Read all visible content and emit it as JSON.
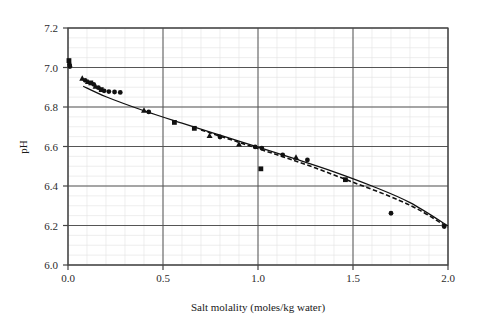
{
  "chart_data": {
    "type": "scatter",
    "title": "",
    "xlabel": "Salt molality (moles/kg water)",
    "ylabel": "pH",
    "xlim": [
      0.0,
      2.0
    ],
    "ylim": [
      6.0,
      7.2
    ],
    "xticks": [
      "0.0",
      "0.5",
      "1.0",
      "1.5",
      "2.0"
    ],
    "xtick_values": [
      0.0,
      0.5,
      1.0,
      1.5,
      2.0
    ],
    "yticks": [
      "6.0",
      "6.2",
      "6.4",
      "6.6",
      "6.8",
      "7.0",
      "7.2"
    ],
    "ytick_values": [
      6.0,
      6.2,
      6.4,
      6.6,
      6.8,
      7.0,
      7.2
    ],
    "grid": "major-horizontal-and-vertical-plus-faint-minor",
    "legend": "none",
    "minor_x_step": 0.1,
    "minor_y_step": 0.05,
    "colors": {
      "marker": "#111111",
      "fit_solid": "#111111",
      "fit_dashed": "#111111",
      "major_grid": "#555555",
      "minor_grid": "#e3e3e3",
      "axis": "#444444",
      "background": "#ffffff"
    },
    "series": [
      {
        "name": "Measured pH",
        "marker": "mixed",
        "points": [
          {
            "x": 0.005,
            "y": 7.035,
            "m": "square"
          },
          {
            "x": 0.008,
            "y": 7.015,
            "m": "circle"
          },
          {
            "x": 0.01,
            "y": 7.005,
            "m": "circle"
          },
          {
            "x": 0.075,
            "y": 6.945,
            "m": "triangle"
          },
          {
            "x": 0.09,
            "y": 6.935,
            "m": "circle"
          },
          {
            "x": 0.105,
            "y": 6.928,
            "m": "triangle"
          },
          {
            "x": 0.12,
            "y": 6.922,
            "m": "square"
          },
          {
            "x": 0.135,
            "y": 6.915,
            "m": "circle"
          },
          {
            "x": 0.145,
            "y": 6.905,
            "m": "triangle"
          },
          {
            "x": 0.16,
            "y": 6.898,
            "m": "circle"
          },
          {
            "x": 0.175,
            "y": 6.888,
            "m": "square"
          },
          {
            "x": 0.19,
            "y": 6.882,
            "m": "circle"
          },
          {
            "x": 0.215,
            "y": 6.878,
            "m": "circle"
          },
          {
            "x": 0.245,
            "y": 6.876,
            "m": "circle"
          },
          {
            "x": 0.275,
            "y": 6.874,
            "m": "circle"
          },
          {
            "x": 0.4,
            "y": 6.783,
            "m": "triangle"
          },
          {
            "x": 0.425,
            "y": 6.775,
            "m": "circle"
          },
          {
            "x": 0.56,
            "y": 6.722,
            "m": "square"
          },
          {
            "x": 0.665,
            "y": 6.692,
            "m": "square"
          },
          {
            "x": 0.745,
            "y": 6.655,
            "m": "triangle"
          },
          {
            "x": 0.8,
            "y": 6.648,
            "m": "circle"
          },
          {
            "x": 0.9,
            "y": 6.612,
            "m": "triangle"
          },
          {
            "x": 0.985,
            "y": 6.598,
            "m": "circle"
          },
          {
            "x": 1.02,
            "y": 6.592,
            "m": "circle"
          },
          {
            "x": 1.015,
            "y": 6.487,
            "m": "square"
          },
          {
            "x": 1.13,
            "y": 6.558,
            "m": "circle"
          },
          {
            "x": 1.2,
            "y": 6.545,
            "m": "triangle"
          },
          {
            "x": 1.26,
            "y": 6.532,
            "m": "circle"
          },
          {
            "x": 1.46,
            "y": 6.432,
            "m": "square"
          },
          {
            "x": 1.7,
            "y": 6.262,
            "m": "circle"
          },
          {
            "x": 1.98,
            "y": 6.195,
            "m": "circle"
          }
        ]
      }
    ],
    "fit_curves": [
      {
        "name": "Model fit (solid)",
        "style": "solid",
        "points": [
          {
            "x": 0.08,
            "y": 6.905
          },
          {
            "x": 0.2,
            "y": 6.852
          },
          {
            "x": 0.4,
            "y": 6.781
          },
          {
            "x": 0.6,
            "y": 6.718
          },
          {
            "x": 0.8,
            "y": 6.657
          },
          {
            "x": 1.0,
            "y": 6.597
          },
          {
            "x": 1.2,
            "y": 6.536
          },
          {
            "x": 1.4,
            "y": 6.472
          },
          {
            "x": 1.6,
            "y": 6.4
          },
          {
            "x": 1.8,
            "y": 6.316
          },
          {
            "x": 2.0,
            "y": 6.198
          }
        ]
      },
      {
        "name": "Model fit (dashed)",
        "style": "dashed",
        "points": [
          {
            "x": 0.7,
            "y": 6.684
          },
          {
            "x": 0.9,
            "y": 6.621
          },
          {
            "x": 1.1,
            "y": 6.558
          },
          {
            "x": 1.3,
            "y": 6.492
          },
          {
            "x": 1.5,
            "y": 6.419
          },
          {
            "x": 1.7,
            "y": 6.345
          },
          {
            "x": 1.85,
            "y": 6.278
          },
          {
            "x": 2.0,
            "y": 6.19
          }
        ]
      }
    ]
  }
}
